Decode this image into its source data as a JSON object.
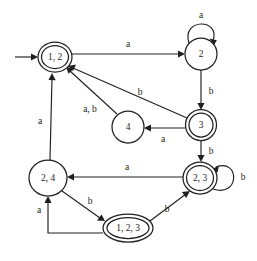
{
  "diagram": {
    "type": "finite-state-automaton",
    "alphabet": [
      "a",
      "b"
    ],
    "start_state": "1, 2",
    "accepting_states": [
      "1, 2",
      "3",
      "2, 3",
      "1, 2, 3"
    ],
    "colors": {
      "stroke": "#231f20",
      "background": "#ffffff",
      "label": "#231f20"
    },
    "states": [
      {
        "id": "s12",
        "label": "1, 2",
        "accepting": true,
        "start": true,
        "cx": 55,
        "cy": 57,
        "rx": 17,
        "ry": 15
      },
      {
        "id": "s2",
        "label": "2",
        "accepting": false,
        "start": false,
        "cx": 201,
        "cy": 54,
        "rx": 16,
        "ry": 16
      },
      {
        "id": "s3",
        "label": "3",
        "accepting": true,
        "start": false,
        "cx": 201,
        "cy": 125,
        "rx": 15,
        "ry": 15
      },
      {
        "id": "s4",
        "label": "4",
        "accepting": false,
        "start": false,
        "cx": 128,
        "cy": 127,
        "rx": 16,
        "ry": 16
      },
      {
        "id": "s24",
        "label": "2, 4",
        "accepting": false,
        "start": false,
        "cx": 48,
        "cy": 178,
        "rx": 19,
        "ry": 18
      },
      {
        "id": "s23",
        "label": "2, 3",
        "accepting": true,
        "start": false,
        "cx": 200,
        "cy": 178,
        "rx": 17,
        "ry": 16
      },
      {
        "id": "s123",
        "label": "1, 2, 3",
        "accepting": true,
        "start": false,
        "cx": 128,
        "cy": 228,
        "rx": 25,
        "ry": 14
      }
    ],
    "transitions": [
      {
        "from": "1, 2",
        "to": "2",
        "label": "a",
        "label_x": 128,
        "label_y": 45
      },
      {
        "from": "2",
        "to": "2",
        "label": "a",
        "label_x": 201,
        "label_y": 16,
        "self_loop": true
      },
      {
        "from": "2",
        "to": "3",
        "label": "b",
        "label_x": 211,
        "label_y": 92
      },
      {
        "from": "3",
        "to": "4",
        "label": "a",
        "label_x": 163,
        "label_y": 140
      },
      {
        "from": "3",
        "to": "1, 2",
        "label": "b",
        "label_x": 140,
        "label_y": 93
      },
      {
        "from": "4",
        "to": "1, 2",
        "label": "a, b",
        "label_x": 90,
        "label_y": 110
      },
      {
        "from": "3",
        "to": "2, 3",
        "label": "b",
        "label_x": 211,
        "label_y": 152
      },
      {
        "from": "2, 3",
        "to": "2, 3",
        "label": "b",
        "label_x": 243,
        "label_y": 178,
        "self_loop": true
      },
      {
        "from": "2, 3",
        "to": "2, 4",
        "label": "a",
        "label_x": 127,
        "label_y": 168
      },
      {
        "from": "2, 4",
        "to": "1, 2",
        "label": "a",
        "label_x": 40,
        "label_y": 122
      },
      {
        "from": "2, 4",
        "to": "1, 2, 3",
        "label": "b",
        "label_x": 90,
        "label_y": 202
      },
      {
        "from": "1, 2, 3",
        "to": "2, 3",
        "label": "b",
        "label_x": 167,
        "label_y": 210
      },
      {
        "from": "1, 2, 3",
        "to": "2, 4",
        "label": "a",
        "label_x": 39,
        "label_y": 211
      }
    ]
  }
}
